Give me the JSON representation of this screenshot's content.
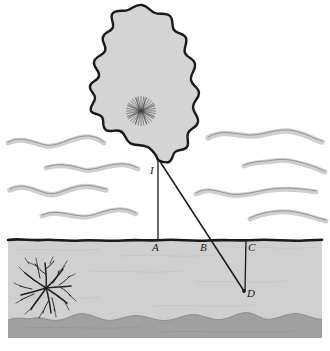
{
  "figure": {
    "background_color": "#ffffff",
    "width": 330,
    "height": 351
  },
  "colors": {
    "outline": "#1a1a1a",
    "cloud_fill": "#d4d4d4",
    "ground_fill": "#d0d0d0",
    "bedrock_fill": "#a0a0a0",
    "wisp": "#c9c9c9",
    "wisp_edge": "#8a8a8a",
    "label_color": "#1a1a1a"
  },
  "labels": {
    "I": {
      "text": "I",
      "x": 150,
      "y": 165
    },
    "A": {
      "text": "A",
      "x": 152,
      "y": 242
    },
    "B": {
      "text": "B",
      "x": 200,
      "y": 242
    },
    "C": {
      "text": "C",
      "x": 248,
      "y": 242
    },
    "D": {
      "text": "D",
      "x": 247,
      "y": 288
    }
  },
  "geometry": {
    "cloud_tip": {
      "x": 158,
      "y": 160
    },
    "strike_point_A": {
      "x": 158,
      "y": 240
    },
    "strike_point_B": {
      "x": 212,
      "y": 239
    },
    "strike_point_C": {
      "x": 246,
      "y": 239
    },
    "strike_point_D": {
      "x": 244,
      "y": 291
    },
    "ground_surface_y": 240,
    "bedrock_top_y": 318
  },
  "elements": {
    "cloud": "storm-cloud-outline",
    "cloud_discharge": "radial-discharge-burst-in-cloud",
    "ground_discharge": "dendritic-root-burst-in-ground",
    "wisps_left_count": 4,
    "wisps_right_count": 4,
    "strike_channels": [
      "I-to-A vertical channel",
      "I-to-D slanted channel through B",
      "C-to-D vertical channel"
    ]
  }
}
